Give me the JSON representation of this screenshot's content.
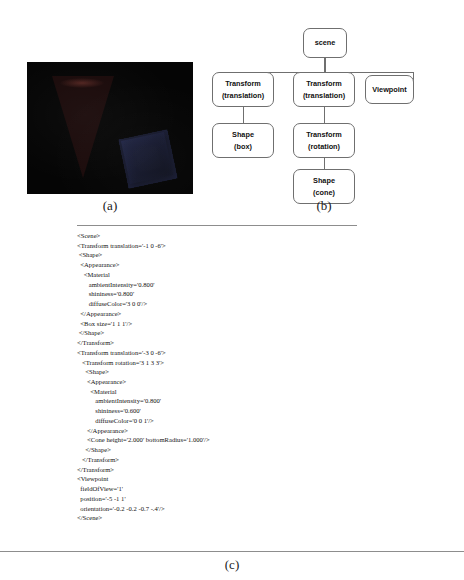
{
  "figure": {
    "panel_a": {
      "caption": "(a)",
      "render": {
        "background_color": "#050505",
        "shapes": [
          {
            "name": "cone",
            "color": "#2a1010",
            "note": "dark red cone, apex down"
          },
          {
            "name": "box",
            "color": "#11131f",
            "note": "dark blue rotated box"
          }
        ]
      }
    },
    "panel_b": {
      "caption": "(b)",
      "nodes": [
        {
          "id": "scene",
          "lines": [
            "scene"
          ]
        },
        {
          "id": "transform-1",
          "lines": [
            "Transform",
            "(translation)"
          ]
        },
        {
          "id": "transform-2",
          "lines": [
            "Transform",
            "(translation)"
          ]
        },
        {
          "id": "viewpoint",
          "lines": [
            "Viewpoint"
          ]
        },
        {
          "id": "shape-box",
          "lines": [
            "Shape",
            "(box)"
          ]
        },
        {
          "id": "transform-rot",
          "lines": [
            "Transform",
            "(rotation)"
          ]
        },
        {
          "id": "shape-cone",
          "lines": [
            "Shape",
            "(cone)"
          ]
        }
      ],
      "edge_color": "#6f6f6f"
    },
    "panel_c": {
      "caption": "(c)",
      "code": "<Scene>\n<Transform translation='-1 0 -6'>\n <Shape>\n  <Appearance>\n    <Material\n       ambientIntensity='0.800'\n       shininess='0.800'\n       diffuseColor='3 0 0'/>\n  </Appearance>\n  <Box size='1 1 1'/>\n </Shape>\n</Transform>\n<Transform translation='-3 0 -6'>\n   <Transform rotation='3 1 3 3'>\n     <Shape>\n      <Appearance>\n        <Material\n           ambientIntensity='0.800'\n           shininess='0.600'\n           diffuseColor='0 0 1'/>\n      </Appearance>\n      <Cone height='2.000' bottomRadius='1.000'/>\n     </Shape>\n   </Transform>\n</Transform>\n<Viewpoint\n  fieldOfView='1'\n  position='-5 -1 1'\n  orientation='-0.2 -0.2 -0.7 -.4'/>\n</Scene>"
    }
  }
}
